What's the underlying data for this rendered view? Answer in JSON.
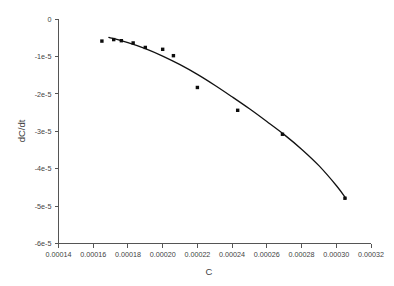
{
  "chart_data": {
    "type": "scatter",
    "title": "",
    "xlabel": "C",
    "ylabel": "dC/dt",
    "xlim": [
      0.00014,
      0.00032
    ],
    "ylim": [
      -6e-05,
      0
    ],
    "grid": false,
    "legend": null,
    "x_ticks": [
      0.00014,
      0.00016,
      0.00018,
      0.0002,
      0.00022,
      0.00024,
      0.00026,
      0.00028,
      0.0003,
      0.00032
    ],
    "x_tick_labels": [
      "0.00014",
      "0.00016",
      "0.00018",
      "0.00020",
      "0.00022",
      "0.00024",
      "0.00026",
      "0.00028",
      "0.00030",
      "0.00032"
    ],
    "y_ticks": [
      0,
      -1e-05,
      -2e-05,
      -3e-05,
      -4e-05,
      -5e-05,
      -6e-05
    ],
    "y_tick_labels": [
      "0",
      "-1e-5",
      "-2e-5",
      "-3e-5",
      "-4e-5",
      "-5e-5",
      "-6e-5"
    ],
    "series": [
      {
        "name": "measured",
        "type": "scatter",
        "marker": "square",
        "color": "#0d0d0d",
        "x": [
          0.000165,
          0.0001718,
          0.0001762,
          0.000183,
          0.00019,
          0.0002,
          0.0002062,
          0.00022,
          0.0002432,
          0.000269,
          0.000305
        ],
        "y": [
          -5.9e-06,
          -5.5e-06,
          -5.8e-06,
          -6.4e-06,
          -7.6e-06,
          -8.1e-06,
          -9.8e-06,
          -1.83e-05,
          -2.44e-05,
          -3.08e-05,
          -4.79e-05
        ]
      },
      {
        "name": "fit",
        "type": "line",
        "color": "#111111",
        "x": [
          0.000169,
          0.00018,
          0.00019,
          0.0002,
          0.00021,
          0.00022,
          0.00023,
          0.00024,
          0.00025,
          0.00026,
          0.00027,
          0.00028,
          0.00029,
          0.0003,
          0.0003055
        ],
        "y": [
          -4.9e-06,
          -6.3e-06,
          -7.9e-06,
          -9.9e-06,
          -1.22e-05,
          -1.48e-05,
          -1.77e-05,
          -2.08e-05,
          -2.4e-05,
          -2.74e-05,
          -3.09e-05,
          -3.48e-05,
          -3.92e-05,
          -4.45e-05,
          -4.79e-05
        ]
      }
    ]
  },
  "axes": {
    "x_axis_label": "C",
    "y_axis_label": "dC/dt"
  }
}
